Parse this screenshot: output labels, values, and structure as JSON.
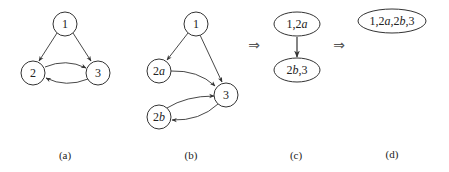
{
  "panels": [
    {
      "id": "a",
      "caption": "(a)",
      "nodes": [
        {
          "id": "1",
          "label": "1"
        },
        {
          "id": "2",
          "label": "2"
        },
        {
          "id": "3",
          "label": "3"
        }
      ],
      "edges": [
        [
          "1",
          "2"
        ],
        [
          "1",
          "3"
        ],
        [
          "2",
          "3"
        ],
        [
          "3",
          "2"
        ]
      ]
    },
    {
      "id": "b",
      "caption": "(b)",
      "nodes": [
        {
          "id": "1",
          "label": "1"
        },
        {
          "id": "2a",
          "label_main": "2",
          "label_sub": "a"
        },
        {
          "id": "3",
          "label": "3"
        },
        {
          "id": "2b",
          "label_main": "2",
          "label_sub": "b"
        }
      ],
      "edges": [
        [
          "1",
          "2a"
        ],
        [
          "1",
          "3"
        ],
        [
          "2a",
          "3"
        ],
        [
          "2b",
          "3"
        ],
        [
          "3",
          "2b"
        ]
      ]
    },
    {
      "id": "c",
      "caption": "(c)",
      "nodes": [
        {
          "id": "1,2a",
          "label_pre": "1,2",
          "label_it": "a",
          "label_post": ""
        },
        {
          "id": "2b,3",
          "label_pre": "2",
          "label_it": "b",
          "label_post": ",3"
        }
      ],
      "edges": [
        [
          "1,2a",
          "2b,3"
        ]
      ]
    },
    {
      "id": "d",
      "caption": "(d)",
      "nodes": [
        {
          "id": "1,2a,2b,3",
          "label_p1": "1,2",
          "label_i1": "a",
          "label_p2": ",2",
          "label_i2": "b",
          "label_p3": ",3"
        }
      ],
      "edges": []
    }
  ],
  "transform_arrows": [
    "⇒",
    "⇒"
  ]
}
